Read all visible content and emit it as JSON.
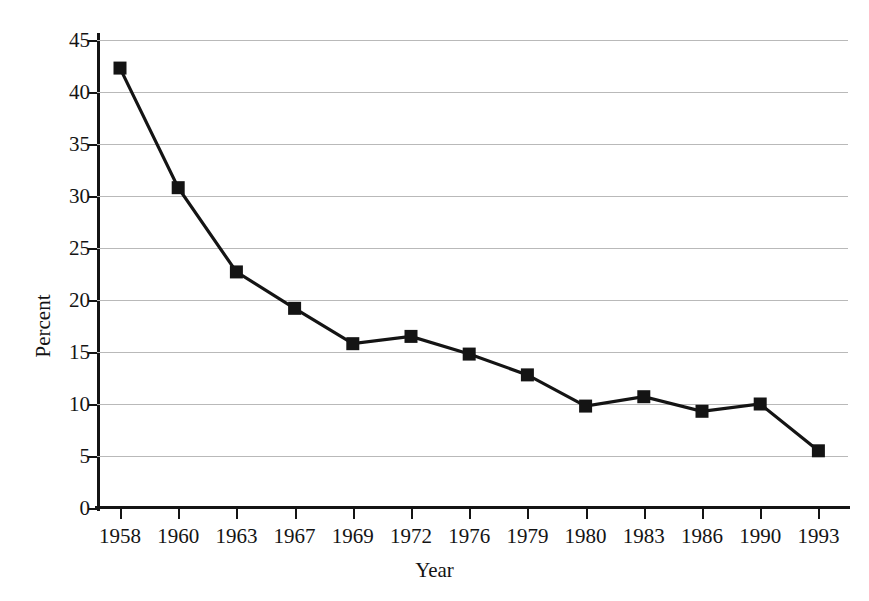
{
  "chart_data": {
    "type": "line",
    "title": "",
    "xlabel": "Year",
    "ylabel": "Percent",
    "categories": [
      "1958",
      "1960",
      "1963",
      "1967",
      "1969",
      "1972",
      "1976",
      "1979",
      "1980",
      "1983",
      "1986",
      "1990",
      "1993"
    ],
    "values": [
      42.3,
      30.8,
      22.7,
      19.2,
      15.8,
      16.5,
      14.8,
      12.8,
      9.8,
      10.7,
      9.3,
      10.0,
      5.5
    ],
    "series": [
      {
        "name": "Percent",
        "values": [
          42.3,
          30.8,
          22.7,
          19.2,
          15.8,
          16.5,
          14.8,
          12.8,
          9.8,
          10.7,
          9.3,
          10.0,
          5.5
        ]
      }
    ],
    "ylim": [
      0,
      45
    ],
    "yticks": [
      0,
      5,
      10,
      15,
      20,
      25,
      30,
      35,
      40,
      45
    ],
    "ytick_labels": [
      "0",
      "5",
      "10",
      "15",
      "20",
      "25",
      "30",
      "35",
      "40",
      "45"
    ],
    "grid": "horizontal",
    "legend": "none",
    "marker": "square",
    "line_color": "#141414",
    "marker_color": "#141414",
    "grid_color": "#b9b9b9",
    "axis_color": "#141414",
    "background_color": "#ffffff"
  }
}
